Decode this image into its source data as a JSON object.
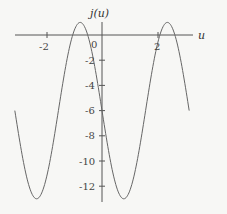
{
  "chart_data": {
    "type": "line",
    "title": "",
    "xlabel": "u",
    "ylabel": "j(u)",
    "function": "j(u) = -6 - 7 sin(2u)",
    "xlim": [
      -3.14159,
      3.14159
    ],
    "ylim": [
      -13,
      1
    ],
    "x_ticks": [
      -2,
      2
    ],
    "x_tick_labels": [
      "-2",
      "2"
    ],
    "origin_label": "0",
    "y_ticks": [
      -2,
      -4,
      -6,
      -8,
      -10,
      -12
    ],
    "y_tick_labels": [
      "-2",
      "-4",
      "-6",
      "-8",
      "-10",
      "-12"
    ],
    "grid": false,
    "legend": null,
    "series": [
      {
        "name": "j(u)",
        "color": "#666666",
        "x": [
          -3.14,
          -2.36,
          -1.57,
          -0.79,
          0,
          0.79,
          1.57,
          2.36,
          3.14
        ],
        "y": [
          -6,
          -13,
          -6,
          1,
          -6,
          -13,
          -6,
          1,
          -6
        ]
      }
    ]
  },
  "labels": {
    "x_axis": "u",
    "y_axis": "j(u)",
    "origin": "0",
    "xt_neg2": "-2",
    "xt_2": "2",
    "yt_2": "-2",
    "yt_4": "-4",
    "yt_6": "-6",
    "yt_8": "-8",
    "yt_10": "-10",
    "yt_12": "-12"
  }
}
